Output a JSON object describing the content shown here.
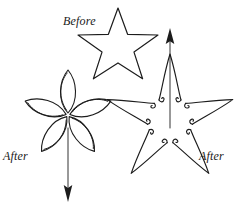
{
  "figure": {
    "canvas": {
      "width": 245,
      "height": 213
    },
    "background_color": "#ffffff",
    "ink_color": "#1c1c1c",
    "labels": {
      "before": "Before",
      "after_left": "After",
      "after_right": "After"
    },
    "shapes": [
      {
        "name": "before-star",
        "kind": "five-pointed-star-outline",
        "label": "Before",
        "center": [
          118,
          49
        ],
        "outer_radius": 41,
        "inner_radius": 17
      },
      {
        "name": "after-flower",
        "kind": "five-lobed-flower-rounded-petals",
        "label": "After",
        "center": [
          68,
          115
        ],
        "petal_length": 44,
        "petal_width": 17,
        "petal_count": 5
      },
      {
        "name": "after-spiky-star",
        "kind": "five-pointed-concave-spiky-star-with-hooks",
        "label": "After",
        "center": [
          170,
          120
        ],
        "spike_length": 66,
        "inner_radius": 22,
        "spike_count": 5
      }
    ],
    "arrows": [
      {
        "name": "up-arrow",
        "direction": "up",
        "x": 170,
        "from_y": 128,
        "to_y": 29
      },
      {
        "name": "down-arrow",
        "direction": "down",
        "x": 68,
        "from_y": 128,
        "to_y": 201
      }
    ]
  }
}
